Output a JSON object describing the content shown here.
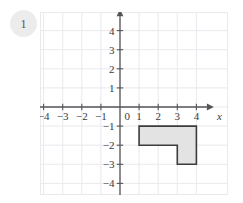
{
  "badge": {
    "number": "1"
  },
  "chart_data": {
    "type": "scatter",
    "title": "",
    "xlabel": "x",
    "ylabel": "y",
    "xlim": [
      -4.2,
      4.5
    ],
    "ylim": [
      -4.5,
      4.7
    ],
    "grid": true,
    "legend": null,
    "x_ticks": [
      {
        "value": -4,
        "label": "−4"
      },
      {
        "value": -3,
        "label": "−3"
      },
      {
        "value": -2,
        "label": "−2"
      },
      {
        "value": -1,
        "label": "−1"
      },
      {
        "value": 0,
        "label": "0"
      },
      {
        "value": 1,
        "label": "1"
      },
      {
        "value": 2,
        "label": "2"
      },
      {
        "value": 3,
        "label": "3"
      },
      {
        "value": 4,
        "label": "4"
      }
    ],
    "y_ticks": [
      {
        "value": 4,
        "label": "4"
      },
      {
        "value": 3,
        "label": "3"
      },
      {
        "value": 2,
        "label": "2"
      },
      {
        "value": 1,
        "label": "1"
      },
      {
        "value": -1,
        "label": "−1"
      },
      {
        "value": -2,
        "label": "−2"
      },
      {
        "value": -3,
        "label": "−3"
      },
      {
        "value": -4,
        "label": "−4"
      }
    ],
    "shapes": [
      {
        "name": "l-shaped-polygon",
        "kind": "polygon",
        "vertices": [
          [
            1,
            -1
          ],
          [
            4,
            -1
          ],
          [
            4,
            -3
          ],
          [
            3,
            -3
          ],
          [
            3,
            -2
          ],
          [
            1,
            -2
          ]
        ],
        "fill": "#e3e3e3",
        "stroke": "#3c3c3c",
        "stroke_width": 1.6
      }
    ],
    "colors": {
      "grid": "#e9e9ef",
      "axis": "#555558",
      "tick_text": "#3a3a3e",
      "shape_fill": "#e3e3e3",
      "shape_stroke": "#3c3c3c",
      "badge_bg": "#ececec",
      "badge_text": "#55555a"
    }
  }
}
